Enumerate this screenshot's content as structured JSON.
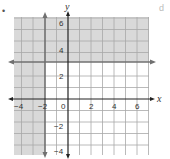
{
  "figure": {
    "problem_marker": "•",
    "corner_label": "d",
    "x_axis_label": "x",
    "y_axis_label": "y",
    "x_ticks": [
      {
        "value": -4,
        "label": "−4"
      },
      {
        "value": -2,
        "label": "−2"
      },
      {
        "value": 0,
        "label": "0"
      },
      {
        "value": 2,
        "label": "2"
      },
      {
        "value": 4,
        "label": "4"
      },
      {
        "value": 6,
        "label": "6"
      }
    ],
    "y_ticks": [
      {
        "value": 6,
        "label": "6"
      },
      {
        "value": 4,
        "label": "4"
      },
      {
        "value": 2,
        "label": "2"
      },
      {
        "value": -2,
        "label": "−2"
      },
      {
        "value": -4,
        "label": "−4"
      }
    ],
    "boundary_lines": [
      {
        "equation": "x = -2",
        "style": "solid",
        "orientation": "vertical"
      },
      {
        "equation": "y = 3",
        "style": "solid",
        "orientation": "horizontal"
      }
    ],
    "shaded_region": "x ≤ -2 or y ≥ 3",
    "colors": {
      "shade": "#d9d9d9",
      "grid": "#9a9a9a",
      "axis": "#222222",
      "boundary": "#707070"
    }
  }
}
